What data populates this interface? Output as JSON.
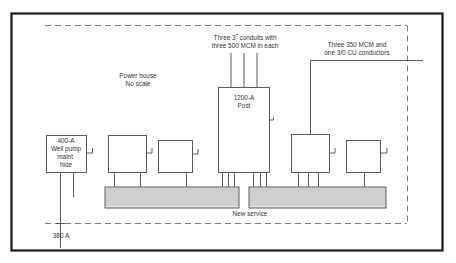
{
  "diagram": {
    "title_block": {
      "line1": "Power house",
      "line2": "No scale"
    },
    "conduit_note": {
      "line1": "Three 3˝ conduits with",
      "line2": "three 500 MCM in each"
    },
    "conductor_note": {
      "line1": "Three 350 MCM and",
      "line2": "one 3/0 CU conductors"
    },
    "main_panel": {
      "line1": "1200-A",
      "line2": "Post"
    },
    "well_pump": {
      "line1": "400-A",
      "line2": "Well pump",
      "line3": "maint.",
      "line4": "hide"
    },
    "bus_label": "New service",
    "feed_label": "380 A",
    "colors": {
      "frame": "#1a1a1a",
      "line": "#4a4a4a",
      "dash": "#6a6a6a",
      "bus_fill": "#e6e6e6"
    }
  }
}
